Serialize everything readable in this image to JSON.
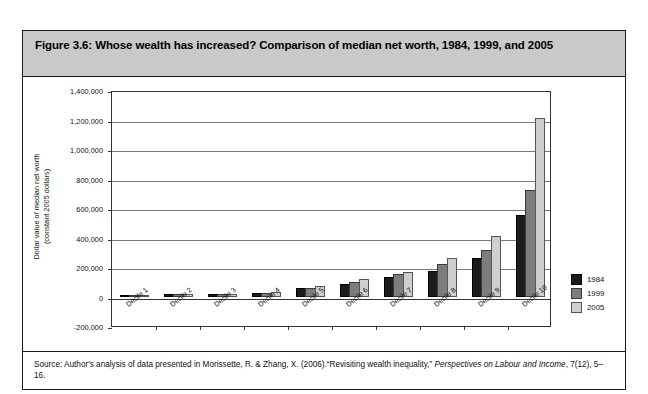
{
  "figure": {
    "title": "Figure 3.6: Whose wealth has increased? Comparison of median net worth, 1984, 1999, and 2005",
    "source_prefix": "Source: Author's analysis of data presented in Morissette, R. & Zhang, X. (2006).“Revisiting wealth inequality,” ",
    "source_italic": "Perspectives on Labour and Income",
    "source_suffix": ", 7(12), 5–16."
  },
  "colors": {
    "series_1984": "#1c1c1c",
    "series_1999": "#7d7d7d",
    "series_2005": "#cfcfcf",
    "title_background": "#c9c9c9",
    "frame": "#1a1a1a",
    "gridline": "#7a7a7a"
  },
  "chart_data": {
    "type": "bar",
    "title": "Whose wealth has increased? Comparison of median net worth, 1984, 1999, and 2005",
    "xlabel": "",
    "ylabel": "Dollar value of median net worth (constant 2005 dollars)",
    "ylabel_line1": "Dollar value of median net worth",
    "ylabel_line2": "(constant 2005 dollars)",
    "categories": [
      "Decile 1",
      "Decile 2",
      "Decile 3",
      "Decile 4",
      "Decile 5",
      "Decile 6",
      "Decile 7",
      "Decile 8",
      "Decile 9",
      "Decile 10"
    ],
    "series": [
      {
        "name": "1984",
        "values": [
          0,
          1000,
          3000,
          13000,
          42000,
          73000,
          118000,
          160000,
          245000,
          540000
        ]
      },
      {
        "name": "1999",
        "values": [
          0,
          500,
          2000,
          10000,
          46000,
          85000,
          140000,
          205000,
          305000,
          710000
        ]
      },
      {
        "name": "2005",
        "values": [
          0,
          500,
          2000,
          14000,
          57000,
          103000,
          150000,
          250000,
          400000,
          1200000
        ]
      }
    ],
    "ylim": [
      -200000,
      1400000
    ],
    "ytick_values": [
      1400000,
      1200000,
      1000000,
      800000,
      600000,
      400000,
      200000,
      0,
      -200000
    ],
    "ytick_labels": [
      "1,400,000",
      "1,200,000",
      "1,000,000",
      "800,000",
      "600,000",
      "400,000",
      "200,000",
      "0",
      "-200,000"
    ],
    "grid": true,
    "legend_position": "right",
    "legend_entries": [
      "1984",
      "1999",
      "2005"
    ]
  }
}
